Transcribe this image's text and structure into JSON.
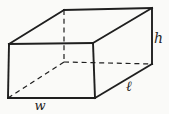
{
  "figure": {
    "type": "rectangular-prism-wireframe",
    "labels": {
      "width": "w",
      "length": "ℓ",
      "height": "h"
    },
    "colors": {
      "line": "#1f1f1f",
      "background": "#fafaf8"
    },
    "edges": [
      {
        "from": [
          8,
          98
        ],
        "to": [
          9,
          44
        ],
        "style": "solid",
        "name": "front-left-edge"
      },
      {
        "from": [
          9,
          44
        ],
        "to": [
          93,
          43
        ],
        "style": "solid",
        "name": "front-top-edge"
      },
      {
        "from": [
          93,
          43
        ],
        "to": [
          95,
          98
        ],
        "style": "solid",
        "name": "front-right-edge"
      },
      {
        "from": [
          95,
          98
        ],
        "to": [
          8,
          98
        ],
        "style": "solid",
        "name": "front-bottom-edge"
      },
      {
        "from": [
          9,
          44
        ],
        "to": [
          64,
          10
        ],
        "style": "solid",
        "name": "top-left-depth-edge"
      },
      {
        "from": [
          64,
          10
        ],
        "to": [
          152,
          8
        ],
        "style": "solid",
        "name": "back-top-edge"
      },
      {
        "from": [
          93,
          43
        ],
        "to": [
          152,
          8
        ],
        "style": "solid",
        "name": "top-right-depth-edge"
      },
      {
        "from": [
          152,
          8
        ],
        "to": [
          152,
          64
        ],
        "style": "solid",
        "name": "back-right-vertical-edge"
      },
      {
        "from": [
          152,
          64
        ],
        "to": [
          95,
          98
        ],
        "style": "solid",
        "name": "bottom-right-depth-edge"
      },
      {
        "from": [
          64,
          10
        ],
        "to": [
          64,
          62
        ],
        "style": "dashed",
        "name": "hidden-back-left-vertical-edge"
      },
      {
        "from": [
          64,
          62
        ],
        "to": [
          152,
          64
        ],
        "style": "dashed",
        "name": "hidden-back-bottom-edge"
      },
      {
        "from": [
          8,
          98
        ],
        "to": [
          64,
          62
        ],
        "style": "dashed",
        "name": "hidden-bottom-left-depth-edge"
      }
    ]
  }
}
